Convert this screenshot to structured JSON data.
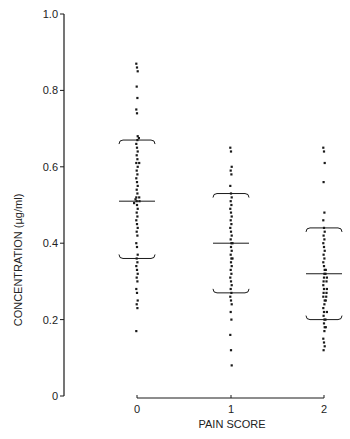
{
  "chart_data": {
    "type": "scatter",
    "subtype": "dot-plot with mean and ±SD brackets",
    "title": "",
    "xlabel": "PAIN SCORE",
    "ylabel": "CONCENTRATION (µg/ml)",
    "ylim": [
      0,
      1.0
    ],
    "y_ticks": [
      "0",
      "0.2",
      "0.4",
      "0.6",
      "0.8",
      "1.0"
    ],
    "y_tick_values": [
      0,
      0.2,
      0.4,
      0.6,
      0.8,
      1.0
    ],
    "categories": [
      "0",
      "1",
      "2"
    ],
    "grid": false,
    "legend": null,
    "groups": [
      {
        "name": "0",
        "mean": 0.51,
        "sd_upper": 0.67,
        "sd_lower": 0.36,
        "values": [
          0.87,
          0.86,
          0.85,
          0.81,
          0.78,
          0.75,
          0.74,
          0.68,
          0.675,
          0.67,
          0.66,
          0.65,
          0.64,
          0.63,
          0.62,
          0.61,
          0.61,
          0.6,
          0.59,
          0.58,
          0.57,
          0.56,
          0.55,
          0.54,
          0.53,
          0.52,
          0.52,
          0.515,
          0.51,
          0.51,
          0.505,
          0.5,
          0.49,
          0.48,
          0.47,
          0.46,
          0.45,
          0.44,
          0.43,
          0.42,
          0.4,
          0.39,
          0.37,
          0.36,
          0.35,
          0.34,
          0.33,
          0.32,
          0.31,
          0.3,
          0.28,
          0.27,
          0.25,
          0.24,
          0.23,
          0.17
        ]
      },
      {
        "name": "1",
        "mean": 0.4,
        "sd_upper": 0.53,
        "sd_lower": 0.27,
        "values": [
          0.65,
          0.64,
          0.6,
          0.59,
          0.58,
          0.55,
          0.53,
          0.52,
          0.51,
          0.5,
          0.49,
          0.48,
          0.47,
          0.46,
          0.45,
          0.44,
          0.43,
          0.42,
          0.41,
          0.4,
          0.4,
          0.39,
          0.38,
          0.37,
          0.36,
          0.36,
          0.35,
          0.34,
          0.33,
          0.32,
          0.31,
          0.3,
          0.29,
          0.28,
          0.27,
          0.26,
          0.25,
          0.24,
          0.22,
          0.2,
          0.16,
          0.12,
          0.08
        ]
      },
      {
        "name": "2",
        "mean": 0.32,
        "sd_upper": 0.44,
        "sd_lower": 0.2,
        "values": [
          0.65,
          0.64,
          0.61,
          0.56,
          0.48,
          0.46,
          0.44,
          0.43,
          0.42,
          0.41,
          0.4,
          0.39,
          0.38,
          0.37,
          0.36,
          0.35,
          0.34,
          0.33,
          0.33,
          0.32,
          0.32,
          0.31,
          0.31,
          0.3,
          0.3,
          0.29,
          0.28,
          0.28,
          0.27,
          0.27,
          0.26,
          0.26,
          0.25,
          0.25,
          0.24,
          0.23,
          0.22,
          0.22,
          0.21,
          0.2,
          0.2,
          0.19,
          0.18,
          0.18,
          0.17,
          0.15,
          0.14,
          0.13,
          0.12
        ]
      }
    ]
  },
  "colors": {
    "ink": "#1a1a1a",
    "background": "#ffffff"
  }
}
